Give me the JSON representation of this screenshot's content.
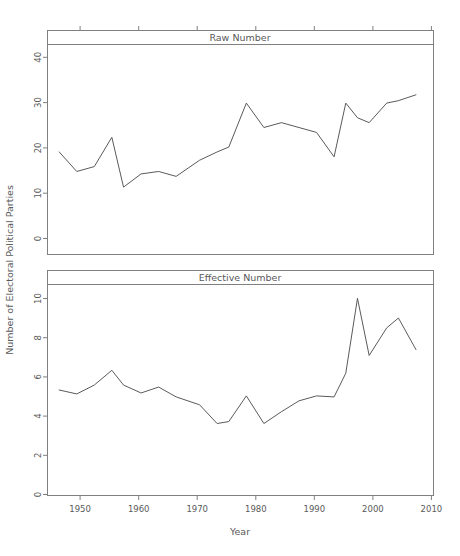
{
  "figure": {
    "xlabel": "Year",
    "ylabel": "Number of Electoral Political Parties",
    "background": "#ffffff",
    "line_color": "#5a5a5a",
    "axis_color": "#808080"
  },
  "chart_data": [
    {
      "type": "line",
      "title": "Raw Number",
      "panel": "top",
      "xlabel": "Year",
      "ylabel": "Number of Electoral Political Parties",
      "xlim": [
        1946,
        2012
      ],
      "ylim": [
        0,
        43
      ],
      "xticks": [
        1950,
        1960,
        1970,
        1980,
        1990,
        2000,
        2010
      ],
      "yticks": [
        0,
        10,
        20,
        30,
        40
      ],
      "grid": false,
      "legend": "none",
      "x": [
        1948,
        1951,
        1954,
        1957,
        1959,
        1962,
        1965,
        1968,
        1972,
        1975,
        1977,
        1980,
        1983,
        1986,
        1989,
        1992,
        1995,
        1997,
        1999,
        2001,
        2004,
        2006,
        2009
      ],
      "values": [
        21,
        17,
        18,
        24,
        13.8,
        16.5,
        17,
        16,
        19.3,
        21,
        22,
        31,
        26,
        27,
        26,
        25,
        20,
        31,
        28,
        27,
        31,
        31.5,
        32.7
      ],
      "series": [
        {
          "name": "Raw Number",
          "values": [
            21,
            17,
            18,
            24,
            13.8,
            16.5,
            17,
            16,
            19.3,
            21,
            22,
            31,
            26,
            27,
            26,
            25,
            20,
            31,
            28,
            27,
            31,
            31.5,
            32.7
          ]
        }
      ]
    },
    {
      "type": "line",
      "title": "Effective Number",
      "panel": "bottom",
      "xlabel": "Year",
      "ylabel": "Number of Electoral Political Parties",
      "xlim": [
        1946,
        2012
      ],
      "ylim": [
        0,
        10.7
      ],
      "xticks": [
        1950,
        1960,
        1970,
        1980,
        1990,
        2000,
        2010
      ],
      "yticks": [
        0,
        2,
        4,
        6,
        8,
        10
      ],
      "grid": false,
      "legend": "none",
      "x": [
        1948,
        1951,
        1954,
        1957,
        1959,
        1962,
        1965,
        1968,
        1972,
        1975,
        1977,
        1980,
        1983,
        1986,
        1989,
        1992,
        1995,
        1997,
        1999,
        2001,
        2004,
        2006,
        2009
      ],
      "values": [
        5.35,
        5.15,
        5.6,
        6.35,
        5.6,
        5.2,
        5.5,
        5.0,
        4.6,
        3.65,
        3.75,
        5.05,
        3.65,
        4.25,
        4.8,
        5.05,
        5.0,
        6.2,
        10.0,
        7.1,
        8.5,
        9.0,
        7.4
      ],
      "series": [
        {
          "name": "Effective Number",
          "values": [
            5.35,
            5.15,
            5.6,
            6.35,
            5.6,
            5.2,
            5.5,
            5.0,
            4.6,
            3.65,
            3.75,
            5.05,
            3.65,
            4.25,
            4.8,
            5.05,
            5.0,
            6.2,
            10.0,
            7.1,
            8.5,
            9.0,
            7.4
          ]
        }
      ]
    }
  ]
}
